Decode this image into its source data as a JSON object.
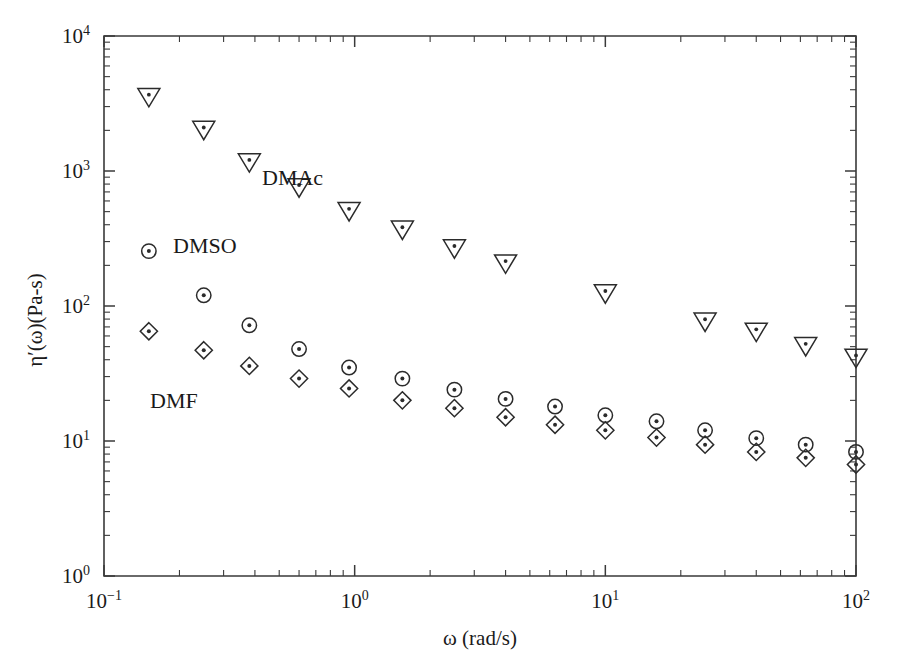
{
  "chart_data": {
    "type": "scatter",
    "title": "",
    "xlabel": "ω (rad/s)",
    "ylabel": "η′(ω)(Pa-s)",
    "xscale": "log",
    "yscale": "log",
    "xlim": [
      0.1,
      100
    ],
    "ylim": [
      1,
      10000
    ],
    "grid": false,
    "legend_position": "inline-annotations",
    "xticks": [
      "10⁻¹",
      "10⁰",
      "10¹",
      "10²"
    ],
    "xtick_values": [
      0.1,
      1,
      10,
      100
    ],
    "yticks": [
      "10⁰",
      "10¹",
      "10²",
      "10³",
      "10⁴"
    ],
    "ytick_values": [
      1,
      10,
      100,
      1000,
      10000
    ],
    "series": [
      {
        "name": "DMAc",
        "marker": "triangle-down-dot",
        "x": [
          0.151,
          0.25,
          0.38,
          0.6,
          0.95,
          1.55,
          2.5,
          4.0,
          10.0,
          25.0,
          40.0,
          63.0,
          100.0
        ],
        "y": [
          3500,
          2000,
          1150,
          750,
          500,
          365,
          265,
          205,
          123,
          76,
          64,
          50,
          41
        ]
      },
      {
        "name": "DMSO",
        "marker": "circle-dot",
        "x": [
          0.151,
          0.25,
          0.38,
          0.6,
          0.95,
          1.55,
          2.5,
          4.0,
          6.3,
          10.0,
          16.0,
          25.0,
          40.0,
          63.0,
          100.0
        ],
        "y": [
          255,
          120,
          72,
          48,
          35,
          29,
          24,
          20.5,
          18,
          15.5,
          14,
          12,
          10.5,
          9.4,
          8.3
        ]
      },
      {
        "name": "DMF",
        "marker": "diamond-dot",
        "x": [
          0.151,
          0.25,
          0.38,
          0.6,
          0.95,
          1.55,
          2.5,
          4.0,
          6.3,
          10.0,
          16.0,
          25.0,
          40.0,
          63.0,
          100.0
        ],
        "y": [
          65,
          47,
          36,
          29,
          24.5,
          20,
          17.5,
          15,
          13.2,
          12,
          10.6,
          9.4,
          8.3,
          7.5,
          6.7
        ]
      }
    ],
    "annotations": [
      {
        "text": "DMAc",
        "x_px": 262,
        "y_px": 185
      },
      {
        "text": "DMSO",
        "x_px": 173,
        "y_px": 253
      },
      {
        "text": "DMF",
        "x_px": 150,
        "y_px": 408
      }
    ]
  },
  "axes": {
    "x_title": "ω (rad/s)",
    "y_title": "η′(ω)(Pa-s)"
  },
  "colors": {
    "background": "#ffffff",
    "axis": "#3a3a3a",
    "marker": "#2b2b2b",
    "text": "#1a1a1a"
  }
}
